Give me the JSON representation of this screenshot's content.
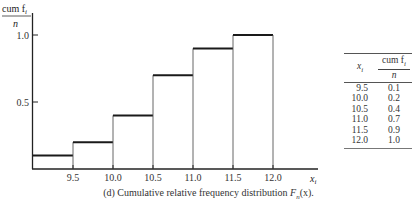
{
  "chart_data": {
    "type": "step",
    "xlabel": "x_i",
    "ylabel": "cum f_i / n",
    "x": [
      9.5,
      10.0,
      10.5,
      11.0,
      11.5,
      12.0
    ],
    "values": [
      0.1,
      0.2,
      0.4,
      0.7,
      0.9,
      1.0
    ],
    "x_ticks": [
      "9.5",
      "10.0",
      "10.5",
      "11.0",
      "11.5",
      "12.0"
    ],
    "y_ticks": [
      "0.5",
      "1.0"
    ],
    "ylim": [
      0,
      1.0
    ],
    "grid": false,
    "legend": null
  },
  "ylabel": {
    "num": "cum f",
    "sub": "i",
    "den": "n"
  },
  "xlabel": {
    "main": "x",
    "sub": "i"
  },
  "y_tick_labels": {
    "half": "0.5",
    "one": "1.0"
  },
  "x_tick_labels": [
    "9.5",
    "10.0",
    "10.5",
    "11.0",
    "11.5",
    "12.0"
  ],
  "caption": {
    "prefix": "(d) Cumulative relative frequency distribution ",
    "func": "F",
    "func_sub": "n",
    "suffix": "(x)."
  },
  "table": {
    "header_x": "x",
    "header_x_sub": "i",
    "header_cum_num": "cum f",
    "header_cum_sub": "i",
    "header_cum_den": "n",
    "rows": [
      {
        "x": "9.5",
        "cum": "0.1"
      },
      {
        "x": "10.0",
        "cum": "0.2"
      },
      {
        "x": "10.5",
        "cum": "0.4"
      },
      {
        "x": "11.0",
        "cum": "0.7"
      },
      {
        "x": "11.5",
        "cum": "0.9"
      },
      {
        "x": "12.0",
        "cum": "1.0"
      }
    ]
  }
}
